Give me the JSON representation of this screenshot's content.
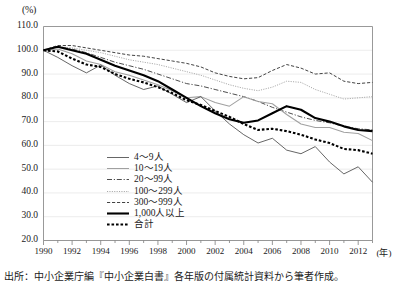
{
  "axis": {
    "unit_label": "(%)",
    "x_unit_label": "(年)",
    "y_ticks": [
      "110.0",
      "100.0",
      "90.0",
      "80.0",
      "70.0",
      "60.0",
      "50.0",
      "40.0",
      "30.0",
      "20.0"
    ],
    "x_ticks": [
      "1990",
      "1992",
      "1994",
      "1996",
      "1998",
      "2000",
      "2002",
      "2004",
      "2006",
      "2008",
      "2010",
      "2012"
    ]
  },
  "legend": {
    "items": [
      {
        "label": "4～9人",
        "style": "thin-solid-dark",
        "color": "#4a4a4a"
      },
      {
        "label": "10～19人",
        "style": "thin-solid-gray",
        "color": "#9a9a9a"
      },
      {
        "label": "20～99人",
        "style": "dash-dot",
        "color": "#3a3a3a"
      },
      {
        "label": "100～299人",
        "style": "fine-dotted",
        "color": "#a8a8a8"
      },
      {
        "label": "300～999人",
        "style": "dashed",
        "color": "#2e2e2e"
      },
      {
        "label": "1,000人以上",
        "style": "thick-solid",
        "color": "#000000"
      },
      {
        "label": "合計",
        "style": "thick-dotted",
        "color": "#000000"
      }
    ]
  },
  "source": {
    "text": "出所：中小企業庁編『中小企業白書』各年版の付属統計資料から筆者作成。"
  },
  "chart_data": {
    "type": "line",
    "title": "",
    "subtitle": "",
    "xlabel": "(年)",
    "ylabel": "(%)",
    "xlim": [
      1990,
      2013
    ],
    "ylim": [
      20.0,
      110.0
    ],
    "ytick_step": 10.0,
    "grid": "horizontal",
    "legend_position": "inside-lower-left",
    "x": [
      1990,
      1991,
      1992,
      1993,
      1994,
      1995,
      1996,
      1997,
      1998,
      1999,
      2000,
      2001,
      2002,
      2003,
      2004,
      2005,
      2006,
      2007,
      2008,
      2009,
      2010,
      2011,
      2012,
      2013
    ],
    "series": [
      {
        "name": "4～9人",
        "style": "thin-solid-dark",
        "values": [
          100.0,
          97.0,
          93.5,
          90.5,
          93.8,
          89.5,
          86.0,
          83.5,
          85.0,
          81.5,
          78.0,
          80.5,
          74.5,
          69.0,
          64.5,
          61.0,
          63.0,
          58.0,
          56.5,
          59.5,
          53.0,
          48.0,
          51.0,
          44.5
        ]
      },
      {
        "name": "10～19人",
        "style": "thin-solid-gray",
        "values": [
          100.0,
          100.5,
          98.5,
          95.5,
          94.0,
          91.0,
          89.5,
          87.5,
          85.5,
          83.0,
          80.0,
          80.5,
          78.0,
          76.5,
          80.5,
          78.5,
          77.5,
          73.0,
          69.0,
          67.5,
          67.5,
          65.5,
          65.0,
          62.0
        ]
      },
      {
        "name": "20～99人",
        "style": "dash-dot",
        "values": [
          100.0,
          101.5,
          100.5,
          99.0,
          97.0,
          95.0,
          93.5,
          92.0,
          90.0,
          88.0,
          86.0,
          85.0,
          83.5,
          82.0,
          80.5,
          78.5,
          76.0,
          74.0,
          72.0,
          70.5,
          69.5,
          68.0,
          67.0,
          66.5
        ]
      },
      {
        "name": "100～299人",
        "style": "fine-dotted",
        "values": [
          100.0,
          101.5,
          101.0,
          100.0,
          99.0,
          97.5,
          96.0,
          95.0,
          94.0,
          92.5,
          91.0,
          89.5,
          87.5,
          85.5,
          84.0,
          83.0,
          84.5,
          87.0,
          86.5,
          83.5,
          81.5,
          79.5,
          80.0,
          80.5
        ]
      },
      {
        "name": "300～999人",
        "style": "dashed",
        "values": [
          100.0,
          102.0,
          102.0,
          101.0,
          100.0,
          99.0,
          98.0,
          97.5,
          96.5,
          95.5,
          94.5,
          93.0,
          90.5,
          89.0,
          88.0,
          88.5,
          91.5,
          94.0,
          92.5,
          90.0,
          90.5,
          87.0,
          86.0,
          86.5
        ]
      },
      {
        "name": "1,000人以上",
        "style": "thick-solid",
        "values": [
          100.0,
          101.5,
          100.0,
          98.5,
          96.0,
          93.5,
          91.5,
          89.5,
          87.0,
          83.5,
          80.0,
          76.5,
          73.5,
          71.0,
          69.5,
          70.5,
          73.5,
          76.5,
          75.0,
          71.5,
          70.0,
          68.0,
          66.5,
          66.0
        ]
      },
      {
        "name": "合計",
        "style": "thick-dotted",
        "values": [
          100.0,
          99.5,
          96.5,
          94.0,
          93.0,
          90.0,
          88.0,
          86.5,
          84.5,
          82.0,
          79.0,
          77.0,
          74.5,
          72.0,
          69.0,
          66.5,
          67.0,
          66.0,
          64.5,
          62.5,
          61.0,
          58.5,
          58.0,
          56.5
        ]
      }
    ]
  }
}
